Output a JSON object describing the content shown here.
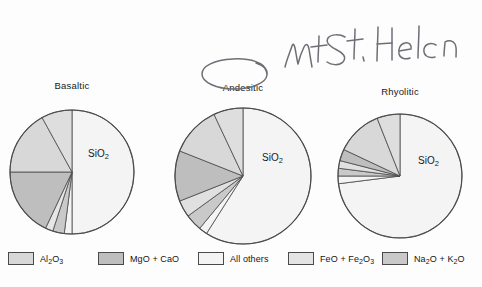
{
  "figure": {
    "background_color": "#fdfdfd",
    "outline_color": "#4a4a4a"
  },
  "annotation": {
    "handwriting_text": "Mt St. Helen",
    "circled_label": "Andesitic",
    "ink_color": "#6b6b72"
  },
  "legend": {
    "items": [
      {
        "label_html": "Al<sub>2</sub>O<sub>3</sub>",
        "label_plain": "Al2O3",
        "color": "#d8d8d8",
        "x": 8
      },
      {
        "label_html": "MgO + CaO",
        "label_plain": "MgO + CaO",
        "color": "#bebebe",
        "x": 98
      },
      {
        "label_html": "All others",
        "label_plain": "All others",
        "color": "#f4f4f4",
        "x": 198
      },
      {
        "label_html": "FeO + Fe<sub>2</sub>O<sub>3</sub>",
        "label_plain": "FeO + Fe2O3",
        "color": "#e4e4e4",
        "x": 288
      },
      {
        "label_html": "Na<sub>2</sub>O + K<sub>2</sub>O",
        "label_plain": "Na2O + K2O",
        "color": "#c9c9c9",
        "x": 382
      }
    ]
  },
  "chart_data": {
    "type": "pie",
    "title": "",
    "subtitle": "",
    "legend_position": "bottom",
    "grid": false,
    "slice_label": "SiO2",
    "slice_label_html": "SiO<sub>2</sub>",
    "categories": [
      "SiO2",
      "Al2O3",
      "MgO + CaO",
      "FeO + Fe2O3",
      "Na2O + K2O",
      "All others"
    ],
    "category_colors": [
      "#f4f4f4",
      "#d8d8d8",
      "#bebebe",
      "#e4e4e4",
      "#c9c9c9",
      "#f4f4f4"
    ],
    "charts": [
      {
        "title": "Basaltic",
        "cx": 72,
        "cy": 172,
        "r": 62,
        "label_x": 88,
        "label_y": 148,
        "title_x": 72,
        "title_y": 80,
        "slices": [
          {
            "name": "SiO2",
            "value": 50,
            "color": "#f4f4f4"
          },
          {
            "name": "All others",
            "value": 2,
            "color": "#f4f4f4"
          },
          {
            "name": "Na2O + K2O",
            "value": 3,
            "color": "#c9c9c9"
          },
          {
            "name": "FeO + Fe2O3",
            "value": 2,
            "color": "#e6e6e6"
          },
          {
            "name": "MgO + CaO",
            "value": 18,
            "color": "#bebebe"
          },
          {
            "name": "Al2O3",
            "value": 17,
            "color": "#d8d8d8"
          },
          {
            "name": "Al2O3b",
            "value": 8,
            "color": "#dedede"
          }
        ]
      },
      {
        "title": "Andesitic",
        "cx": 243,
        "cy": 176,
        "r": 68,
        "label_x": 262,
        "label_y": 152,
        "title_x": 243,
        "title_y": 82,
        "slices": [
          {
            "name": "SiO2",
            "value": 59,
            "color": "#f4f4f4"
          },
          {
            "name": "All others",
            "value": 2,
            "color": "#f4f4f4"
          },
          {
            "name": "Na2O + K2O",
            "value": 4,
            "color": "#c9c9c9"
          },
          {
            "name": "FeO + Fe2O3",
            "value": 4,
            "color": "#e0e0e0"
          },
          {
            "name": "MgO + CaO",
            "value": 12,
            "color": "#bebebe"
          },
          {
            "name": "Al2O3",
            "value": 12,
            "color": "#d8d8d8"
          },
          {
            "name": "Al2O3b",
            "value": 7,
            "color": "#dedede"
          }
        ]
      },
      {
        "title": "Rhyolitic",
        "cx": 400,
        "cy": 176,
        "r": 62,
        "label_x": 418,
        "label_y": 155,
        "title_x": 400,
        "title_y": 86,
        "slices": [
          {
            "name": "SiO2",
            "value": 73,
            "color": "#f4f4f4"
          },
          {
            "name": "All others",
            "value": 2,
            "color": "#f4f4f4"
          },
          {
            "name": "Na2O + K2O",
            "value": 2,
            "color": "#c9c9c9"
          },
          {
            "name": "FeO + Fe2O3",
            "value": 2,
            "color": "#e0e0e0"
          },
          {
            "name": "MgO + CaO",
            "value": 3,
            "color": "#bebebe"
          },
          {
            "name": "Al2O3",
            "value": 12,
            "color": "#d8d8d8"
          },
          {
            "name": "Al2O3b",
            "value": 6,
            "color": "#dedede"
          }
        ]
      }
    ]
  }
}
